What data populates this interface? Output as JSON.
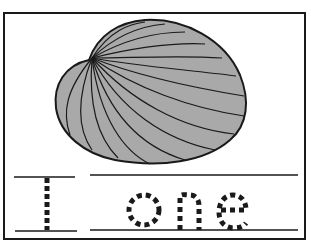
{
  "worksheet": {
    "letter": "I",
    "word": "one",
    "picture": "clam-shell",
    "colors": {
      "shell_fill": "#a9a9a9",
      "ink": "#1a1a1a",
      "background": "#ffffff"
    }
  }
}
